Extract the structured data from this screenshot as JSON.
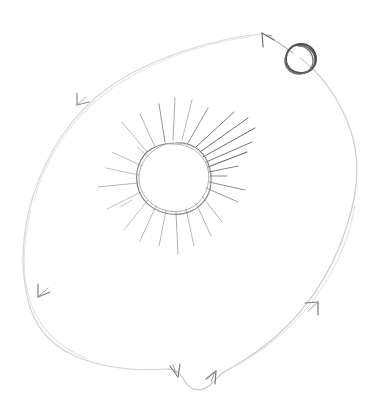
{
  "document": {
    "title": "Hand-drawn solar orbit sketch",
    "medium": "pencil sketch",
    "background_color": "#ffffff",
    "width": 373,
    "height": 411
  },
  "palette": {
    "orbit_light": "#dcdcdc",
    "orbit_mid": "#c8c8c8",
    "arrow_stroke": "#7a7a7a",
    "sun_outline": "#8a8a8a",
    "ray_light": "#b4b4b4",
    "ray_dark": "#6e6e6e",
    "planet_stroke": "#4a4a4a",
    "paper": "#ffffff"
  },
  "scene": {
    "name": "orbit-diagram",
    "description": "A rough hand-drawn sun with radiating rays at center, encircled by a large irregular closed orbit path bearing directional arrowheads, with a small dark circle (planet) riding the orbit at upper right.",
    "elements": [
      {
        "id": "orbit-path",
        "label": "Orbit path",
        "kind": "closed-curve",
        "stroke": "#d2d2d2",
        "stroke_width": 1.2,
        "direction": "counter-clockwise",
        "bounds": {
          "x": 14,
          "y": 32,
          "width": 344,
          "height": 360
        }
      },
      {
        "id": "sun",
        "label": "Sun",
        "kind": "rough-circle-with-rays",
        "center": {
          "x": 174,
          "y": 178
        },
        "radius": 36,
        "ray_count": 24,
        "stroke": "#8a8a8a",
        "stroke_width": 1.1
      },
      {
        "id": "planet",
        "label": "Planet",
        "kind": "small-circle",
        "center": {
          "x": 301,
          "y": 58
        },
        "radius": 14,
        "stroke": "#4a4a4a",
        "stroke_width": 1.8,
        "overdrawn": true
      }
    ],
    "arrowheads": [
      {
        "id": "arrow-top",
        "label": "Arrowhead top (pointing up-left)",
        "position": {
          "x": 262,
          "y": 33
        },
        "angle_deg": 198
      },
      {
        "id": "arrow-upper-left",
        "label": "Arrowhead upper-left (pointing down-left)",
        "position": {
          "x": 76,
          "y": 104
        },
        "angle_deg": 250
      },
      {
        "id": "arrow-left",
        "label": "Arrowhead left (pointing down)",
        "position": {
          "x": 37,
          "y": 295
        },
        "angle_deg": 290
      },
      {
        "id": "arrow-bottom-left",
        "label": "Arrowhead bottom-centre (pointing down-right)",
        "position": {
          "x": 176,
          "y": 370
        },
        "angle_deg": 65
      },
      {
        "id": "arrow-bottom-right",
        "label": "Arrowhead bottom-centre (pointing up-right)",
        "position": {
          "x": 214,
          "y": 373
        },
        "angle_deg": 310
      },
      {
        "id": "arrow-right",
        "label": "Arrowhead right (pointing up-right)",
        "position": {
          "x": 316,
          "y": 300
        },
        "angle_deg": 300
      }
    ]
  }
}
